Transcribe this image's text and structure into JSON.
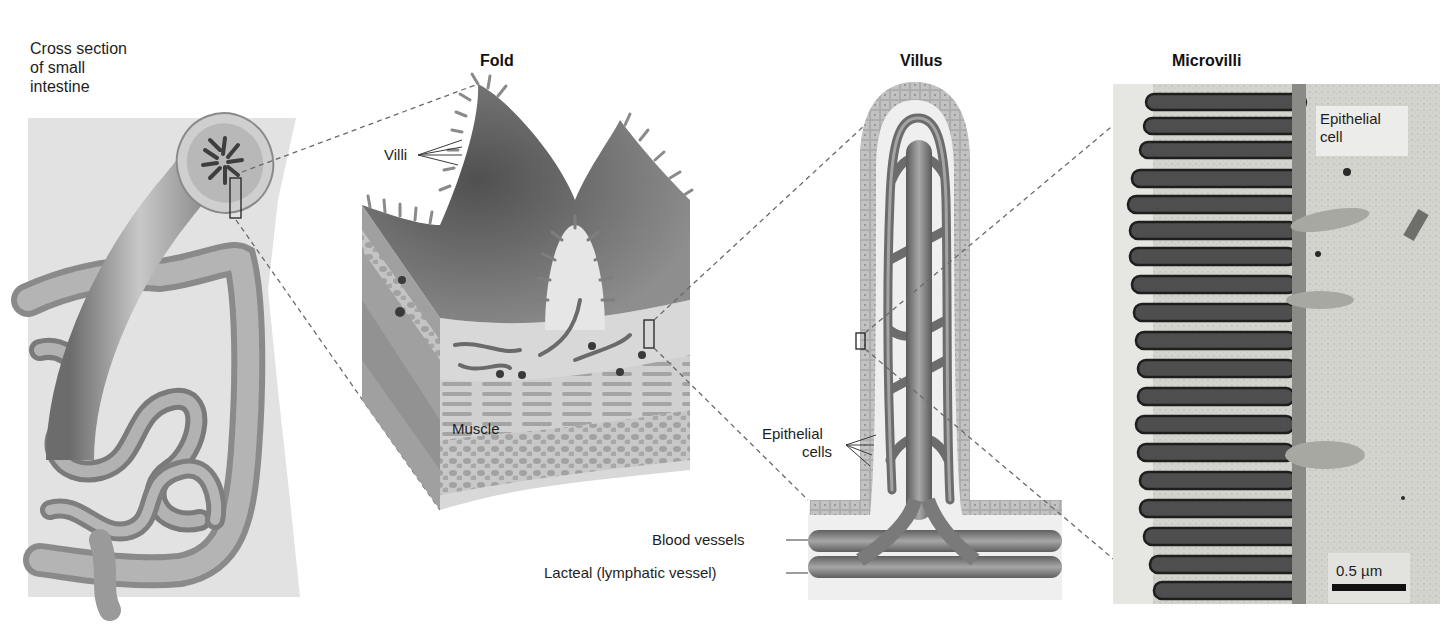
{
  "figure": {
    "panels": [
      {
        "id": "cross-section",
        "title_lines": [
          "Cross section",
          "of small",
          "intestine"
        ]
      },
      {
        "id": "fold",
        "title": "Fold",
        "labels": {
          "villi": "Villi",
          "muscle": "Muscle"
        }
      },
      {
        "id": "villus",
        "title": "Villus",
        "labels": {
          "epithelial_cells_line1": "Epithelial",
          "epithelial_cells_line2": "cells",
          "blood_vessels": "Blood vessels",
          "lacteal": "Lacteal (lymphatic vessel)"
        }
      },
      {
        "id": "microvilli",
        "title": "Microvilli",
        "labels": {
          "epithelial_cell_line1": "Epithelial",
          "epithelial_cell_line2": "cell"
        },
        "scale_bar": "0.5 µm"
      }
    ]
  },
  "colors": {
    "background": "#ffffff",
    "panel_bg": "#e4e4e4",
    "tissue_mid": "#9a9a9a",
    "tissue_dark": "#5e5e5e",
    "vessel": "#7a7a7a",
    "epithelium": "#b8b8b8",
    "dashed_line": "#6a6a6a",
    "micrograph_bg": "#d6d6d0"
  }
}
